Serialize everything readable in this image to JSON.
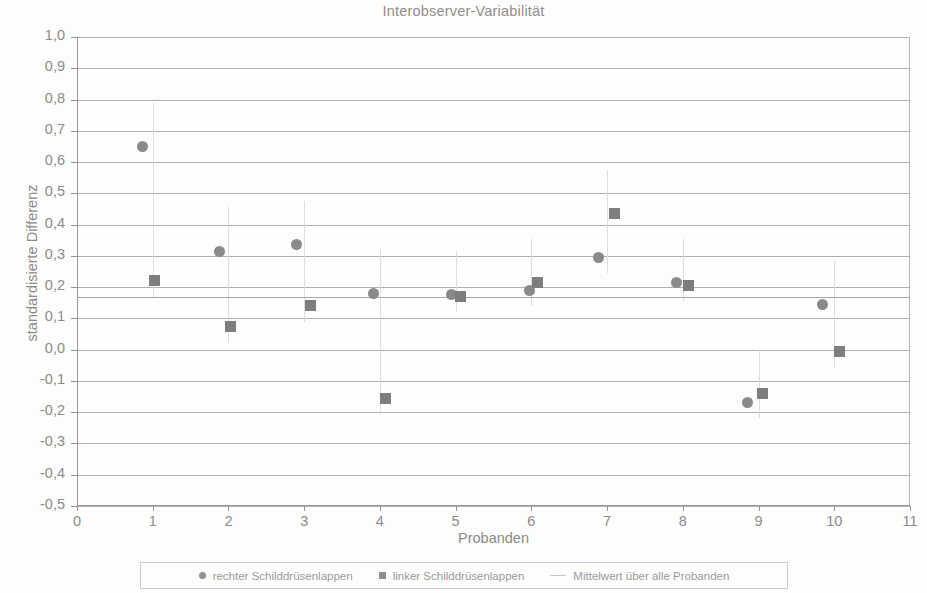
{
  "chart_data": {
    "type": "scatter",
    "title": "Interobserver-Variabilität",
    "xlabel": "Probanden",
    "ylabel": "standardisierte Differenz",
    "xlim": [
      0,
      11
    ],
    "ylim": [
      -0.5,
      1.0
    ],
    "grid": true,
    "legend_position": "bottom",
    "x_ticks": [
      "0",
      "1",
      "2",
      "3",
      "4",
      "5",
      "6",
      "7",
      "8",
      "9",
      "10",
      "11"
    ],
    "x_tick_values": [
      0,
      1,
      2,
      3,
      4,
      5,
      6,
      7,
      8,
      9,
      10,
      11
    ],
    "y_ticks": [
      "1,0",
      "0,9",
      "0,8",
      "0,7",
      "0,6",
      "0,5",
      "0,4",
      "0,3",
      "0,2",
      "0,1",
      "0,0",
      "-0,1",
      "-0,2",
      "-0,3",
      "-0,4",
      "-0,5"
    ],
    "y_tick_values": [
      1.0,
      0.9,
      0.8,
      0.7,
      0.6,
      0.5,
      0.4,
      0.3,
      0.2,
      0.1,
      0.0,
      -0.1,
      -0.2,
      -0.3,
      -0.4,
      -0.5
    ],
    "categories": [
      1,
      2,
      3,
      4,
      5,
      6,
      7,
      8,
      9,
      10
    ],
    "series": [
      {
        "name": "rechter Schilddrüsenlappen",
        "marker": "circle",
        "color": "#8a8a8a",
        "x": [
          0.87,
          1.88,
          2.9,
          3.92,
          4.95,
          5.97,
          6.89,
          7.92,
          8.85,
          9.85
        ],
        "values": [
          0.65,
          0.315,
          0.335,
          0.18,
          0.175,
          0.19,
          0.295,
          0.215,
          -0.17,
          0.145
        ]
      },
      {
        "name": "linker Schilddrüsenlappen",
        "marker": "square",
        "color": "#7d7d7d",
        "x": [
          1.02,
          2.03,
          3.08,
          4.07,
          5.07,
          6.08,
          7.1,
          8.07,
          9.05,
          10.07
        ],
        "values": [
          0.22,
          0.075,
          0.14,
          -0.155,
          0.17,
          0.215,
          0.435,
          0.205,
          -0.14,
          -0.005
        ]
      }
    ],
    "reference_line": {
      "name": "Mittelwert über alle Probanden",
      "value": 0.17,
      "color": "#a5a5a5"
    }
  },
  "legend": {
    "entries": [
      {
        "label": "rechter Schilddrüsenlappen",
        "marker": "circle"
      },
      {
        "label": "linker Schilddrüsenlappen",
        "marker": "square"
      },
      {
        "label": "Mittelwert über alle Probanden",
        "marker": "line"
      }
    ]
  }
}
